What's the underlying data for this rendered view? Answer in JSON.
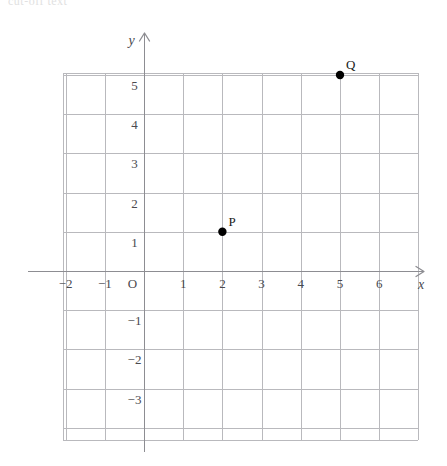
{
  "caption": {
    "fragment": "cut-off text"
  },
  "chart_data": {
    "type": "scatter",
    "title": "",
    "xlabel": "x",
    "ylabel": "y",
    "origin_label": "O",
    "grid": true,
    "legend": "none",
    "xlim": [
      -2.95,
      7.0
    ],
    "ylim": [
      -3.7,
      6.05
    ],
    "xticks": [
      -2,
      -1,
      1,
      2,
      3,
      4,
      5,
      6
    ],
    "yticks": [
      5,
      4,
      3,
      2,
      1,
      -1,
      -2,
      -3
    ],
    "xtick_labels": [
      "-2",
      "-1",
      "1",
      "2",
      "3",
      "4",
      "5",
      "6"
    ],
    "ytick_labels": [
      "5",
      "4",
      "3",
      "2",
      "1",
      "-1",
      "-2",
      "-3"
    ],
    "points": [
      {
        "label": "P",
        "x": 2,
        "y": 1
      },
      {
        "label": "Q",
        "x": 5,
        "y": 5
      }
    ],
    "colors": {
      "point": "#000000",
      "grid": "#b9b9bd",
      "axis": "#8d8d92",
      "text": "#4a4a4f",
      "background": "#ffffff"
    }
  },
  "geometry": {
    "origin_px": {
      "x": 144,
      "y": 271
    },
    "unit_px": 39.2,
    "plot_left_px": 63,
    "plot_right_px": 418,
    "plot_top_px": 73,
    "plot_bottom_px": 440
  }
}
